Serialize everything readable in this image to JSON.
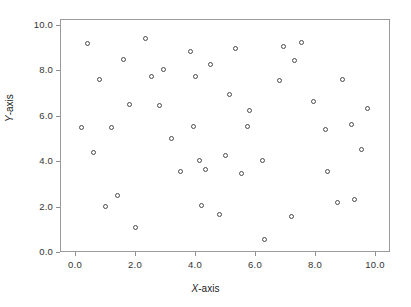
{
  "chart_data": {
    "type": "scatter",
    "title": "",
    "xlabel": "X-axis",
    "ylabel": "Y-axis",
    "xlim": [
      -0.7,
      10.7
    ],
    "ylim": [
      -0.8,
      10.6
    ],
    "grid": false,
    "legend": null,
    "marker": "open-circle",
    "marker_color": "#4a4a4a",
    "xticks": [
      0.0,
      2.0,
      4.0,
      6.0,
      8.0,
      10.0
    ],
    "yticks": [
      0.0,
      2.0,
      4.0,
      6.0,
      8.0,
      10.0
    ],
    "xticklabels": [
      "0.0",
      "2.0",
      "4.0",
      "6.0",
      "8.0",
      "10.0"
    ],
    "yticklabels": [
      "0.0",
      "2.0",
      "4.0",
      "6.0",
      "8.0",
      "10.0"
    ],
    "n_points": 50,
    "points": [
      {
        "x": 0.2,
        "y": 5.5
      },
      {
        "x": 0.4,
        "y": 9.2
      },
      {
        "x": 0.6,
        "y": 4.4
      },
      {
        "x": 0.8,
        "y": 7.6
      },
      {
        "x": 1.0,
        "y": 2.0
      },
      {
        "x": 1.2,
        "y": 5.5
      },
      {
        "x": 1.4,
        "y": 2.5
      },
      {
        "x": 1.6,
        "y": 8.5
      },
      {
        "x": 1.8,
        "y": 6.5
      },
      {
        "x": 2.0,
        "y": 1.1
      },
      {
        "x": 2.35,
        "y": 9.4
      },
      {
        "x": 2.55,
        "y": 7.75
      },
      {
        "x": 2.8,
        "y": 6.45
      },
      {
        "x": 2.95,
        "y": 8.05
      },
      {
        "x": 3.2,
        "y": 5.0
      },
      {
        "x": 3.5,
        "y": 3.55
      },
      {
        "x": 3.85,
        "y": 8.85
      },
      {
        "x": 3.95,
        "y": 5.55
      },
      {
        "x": 4.0,
        "y": 7.75
      },
      {
        "x": 4.15,
        "y": 4.05
      },
      {
        "x": 4.2,
        "y": 2.05
      },
      {
        "x": 4.35,
        "y": 3.65
      },
      {
        "x": 4.5,
        "y": 8.25
      },
      {
        "x": 4.8,
        "y": 1.65
      },
      {
        "x": 5.0,
        "y": 4.25
      },
      {
        "x": 5.15,
        "y": 6.95
      },
      {
        "x": 5.35,
        "y": 8.95
      },
      {
        "x": 5.55,
        "y": 3.45
      },
      {
        "x": 5.75,
        "y": 5.55
      },
      {
        "x": 5.8,
        "y": 6.25
      },
      {
        "x": 6.25,
        "y": 4.05
      },
      {
        "x": 6.3,
        "y": 0.55
      },
      {
        "x": 6.8,
        "y": 7.55
      },
      {
        "x": 6.95,
        "y": 9.05
      },
      {
        "x": 7.2,
        "y": 1.55
      },
      {
        "x": 7.3,
        "y": 8.45
      },
      {
        "x": 7.55,
        "y": 9.25
      },
      {
        "x": 7.95,
        "y": 6.65
      },
      {
        "x": 8.35,
        "y": 5.4
      },
      {
        "x": 8.4,
        "y": 3.55
      },
      {
        "x": 8.75,
        "y": 2.2
      },
      {
        "x": 8.9,
        "y": 7.6
      },
      {
        "x": 9.2,
        "y": 5.6
      },
      {
        "x": 9.3,
        "y": 2.3
      },
      {
        "x": 9.55,
        "y": 4.5
      },
      {
        "x": 9.75,
        "y": 6.3
      }
    ]
  }
}
